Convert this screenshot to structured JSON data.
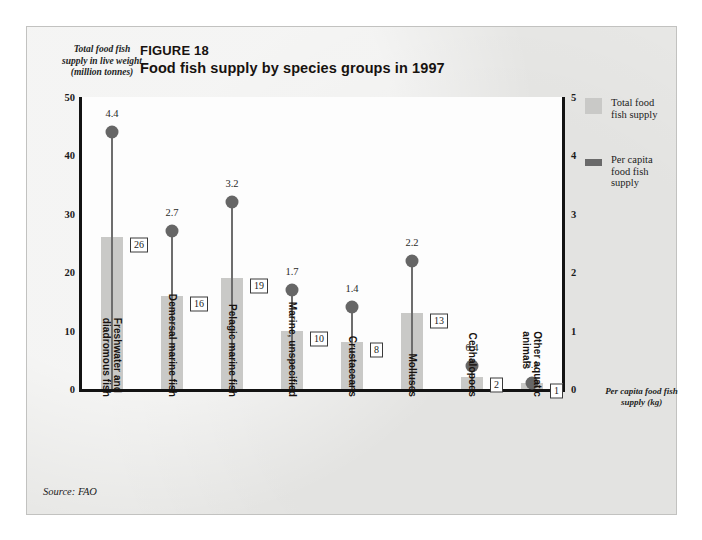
{
  "figure": {
    "number_label": "FIGURE 18",
    "title": "Food fish supply by species groups in 1997",
    "source": "Source: FAO",
    "left_axis_caption": "Total food fish\nsupply in live weight\n(million tonnes)",
    "right_axis_caption": "Per capita food fish\nsupply (kg)"
  },
  "legend": {
    "items": [
      {
        "label": "Total food\nfish supply",
        "swatch": "total-bar-swatch",
        "color": "#c9c9c7"
      },
      {
        "label": "Per capita\nfood fish\nsupply",
        "swatch": "per-capita-marker-swatch",
        "color": "#6a6a6a"
      }
    ]
  },
  "chart_data": {
    "type": "bar",
    "title": "Food fish supply by species groups in 1997",
    "xlabel": "",
    "ylabel": "Total food fish supply in live weight (million tonnes)",
    "y2label": "Per capita food fish supply (kg)",
    "ylim": [
      0,
      50
    ],
    "y2lim": [
      0,
      5
    ],
    "yticks": [
      0,
      10,
      20,
      30,
      40,
      50
    ],
    "y2ticks": [
      0,
      1,
      2,
      3,
      4,
      5
    ],
    "grid": false,
    "legend_position": "right",
    "categories": [
      "Freshwater and\ndiadromous fish",
      "Demersal marine fish",
      "Pelagic marine fish",
      "Marine, unspecified",
      "Crustaceans",
      "Molluscs",
      "Cephalopods",
      "Other aquatic\nanimals"
    ],
    "series": [
      {
        "name": "Total food fish supply",
        "axis": "left",
        "unit": "million tonnes",
        "values": [
          26,
          16,
          19,
          10,
          8,
          13,
          2,
          1
        ],
        "labels": [
          "26",
          "16",
          "19",
          "10",
          "8",
          "13",
          "2",
          "1"
        ]
      },
      {
        "name": "Per capita food fish supply",
        "axis": "right",
        "unit": "kg",
        "values": [
          4.4,
          2.7,
          3.2,
          1.7,
          1.4,
          2.2,
          0.4,
          0.1
        ],
        "labels": [
          "4.4",
          "2.7",
          "3.2",
          "1.7",
          "1.4",
          "2.2",
          "0.4",
          "0.1"
        ]
      }
    ]
  }
}
